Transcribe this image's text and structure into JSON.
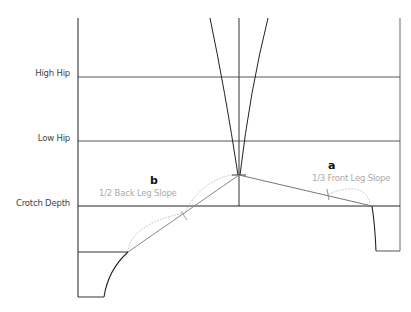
{
  "labels": {
    "high_hip": "High Hip",
    "low_hip": "Low Hip",
    "crotch_depth": "Crotch Depth"
  },
  "annotations": {
    "back": {
      "letter": "b",
      "text": "1/2 Back Leg Slope"
    },
    "front": {
      "letter": "a",
      "text": "1/3 Front Leg Slope"
    }
  },
  "colors": {
    "line": "#333333",
    "slope_line": "#888888",
    "dotted_arc": "#aaaaaa",
    "label": "#444444",
    "sub_label": "#aaaaaa"
  }
}
